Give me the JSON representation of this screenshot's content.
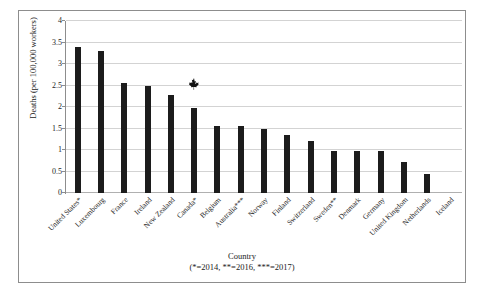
{
  "chart_data": {
    "type": "bar",
    "title": "",
    "xlabel": "Country",
    "xlabel_note": "(*=2014, **=2016, ***=2017)",
    "ylabel": "Deaths (per 100,000 workers)",
    "ylim": [
      0,
      4
    ],
    "ytick_labels": [
      "4",
      "3.5",
      "3",
      "2.5",
      "2",
      "1.5",
      "1",
      "0.5",
      "0"
    ],
    "ytick_values": [
      4,
      3.5,
      3,
      2.5,
      2,
      1.5,
      1,
      0.5,
      0
    ],
    "grid": true,
    "legend": "none",
    "categories": [
      "United States*",
      "Luxembourg",
      "France",
      "Ireland",
      "New Zealand",
      "Canada*",
      "Belgium",
      "Australia***",
      "Norway",
      "Finland",
      "Switzerland",
      "Sweden**",
      "Denmark",
      "Germany",
      "United Kingdom",
      "Netherlands",
      "Iceland"
    ],
    "values": [
      3.4,
      3.3,
      2.57,
      2.48,
      2.27,
      1.98,
      1.57,
      1.57,
      1.48,
      1.35,
      1.22,
      0.97,
      0.97,
      0.97,
      0.72,
      0.45,
      0.0
    ],
    "annotations": [
      {
        "icon": "maple-leaf-icon",
        "label": "Canada highlight",
        "category": "Canada*",
        "value_above": 2.45
      }
    ],
    "bar_color": "#1c1c1c",
    "grid_color": "#d3d3d3",
    "axis_color": "#8d8d8d"
  }
}
